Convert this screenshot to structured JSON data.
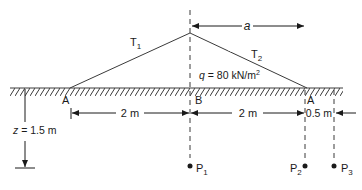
{
  "diagram": {
    "labels": {
      "T1": "T",
      "T1_sub": "1",
      "T2": "T",
      "T2_sub": "2",
      "a": "a",
      "q_prefix": "q",
      "q_value": " = 80 kN/m",
      "q_sup": "2",
      "A_left": "A",
      "B": "B",
      "A_right": "A",
      "dim_AB": "2 m",
      "dim_BA": "2 m",
      "dim_offset": "0.5 m",
      "z_prefix": "z",
      "z_value": " = 1.5 m",
      "P1": "P",
      "P1_sub": "1",
      "P2": "P",
      "P2_sub": "2",
      "P3": "P",
      "P3_sub": "3"
    },
    "colors": {
      "line": "#3a3a3a",
      "text": "#1a1a1a",
      "background": "#ffffff"
    }
  }
}
